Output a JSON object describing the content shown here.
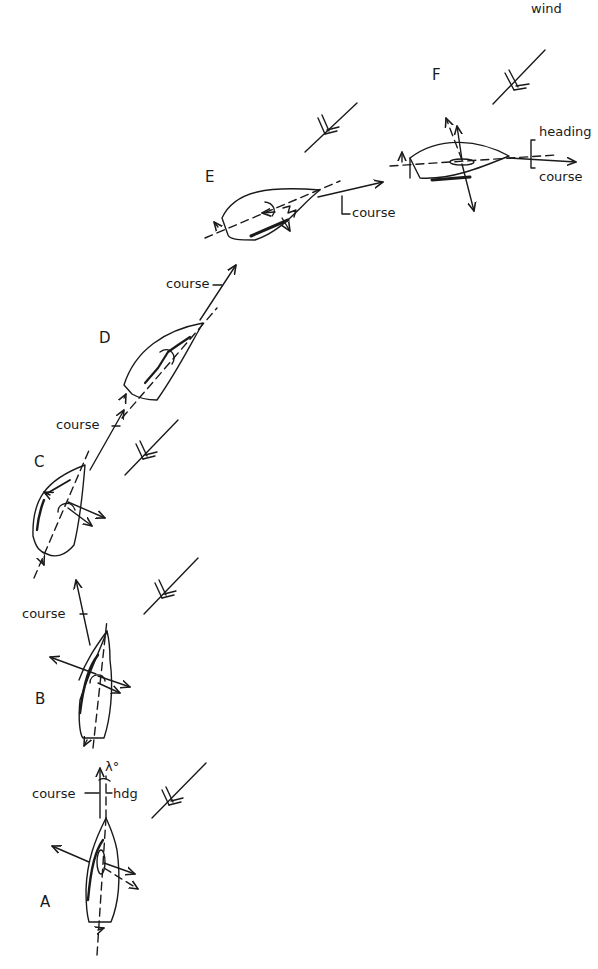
{
  "diagram": {
    "wind_label": "wind",
    "positions": [
      {
        "id": "A",
        "label": "A",
        "annotations": [
          "course",
          "hdg",
          "λ°"
        ]
      },
      {
        "id": "B",
        "label": "B",
        "annotations": [
          "course"
        ]
      },
      {
        "id": "C",
        "label": "C",
        "annotations": [
          "course"
        ]
      },
      {
        "id": "D",
        "label": "D",
        "annotations": [
          "course"
        ]
      },
      {
        "id": "E",
        "label": "E",
        "annotations": [
          "course"
        ]
      },
      {
        "id": "F",
        "label": "F",
        "annotations": [
          "heading",
          "course"
        ]
      }
    ]
  },
  "labels": {
    "wind": "wind",
    "F": "F",
    "F_heading": "heading",
    "F_course": "course",
    "E": "E",
    "E_course": "course",
    "D": "D",
    "D_course": "course",
    "C": "C",
    "C_course": "course",
    "B": "B",
    "B_course": "course",
    "A": "A",
    "A_course": "course",
    "A_hdg": "hdg",
    "A_lambda": "λ°"
  }
}
